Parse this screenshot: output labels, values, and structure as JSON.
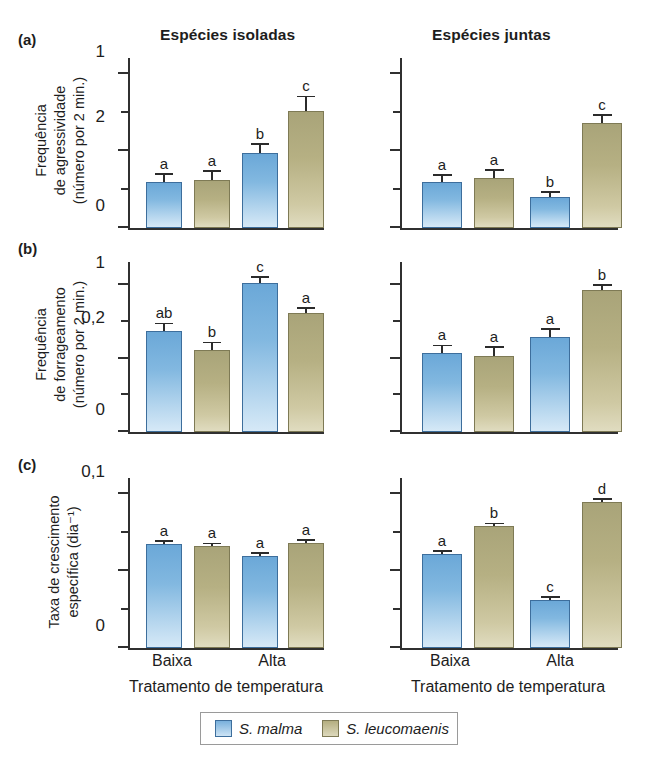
{
  "figure": {
    "column_headers": [
      "Espécies isoladas",
      "Espécies juntas"
    ],
    "xaxis_title": "Tratamento de temperatura",
    "categories": [
      "Baixa",
      "Alta"
    ],
    "legend": [
      {
        "label": "S. malma",
        "color": "#79b0dc",
        "key": "blue"
      },
      {
        "label": "S. leucomaenis",
        "color": "#b4ae80",
        "key": "olive"
      }
    ]
  },
  "panels": {
    "a": {
      "tag": "(a)",
      "ylabel_lines": [
        "Frequência",
        "de agressividade",
        "(número por 2 min.)"
      ],
      "ytick_labels": [
        "0",
        "1",
        "2"
      ]
    },
    "b": {
      "tag": "(b)",
      "ylabel_lines": [
        "Frequência",
        "de forrageamento",
        "(número por 2 min.)"
      ],
      "ytick_labels": [
        "0",
        "1",
        "2"
      ]
    },
    "c": {
      "tag": "(c)",
      "ylabel_lines": [
        "Taxa de crescimento",
        "específica (dia⁻¹)"
      ],
      "ytick_labels": [
        "0",
        "0,1",
        "0,2"
      ]
    }
  },
  "chart_data": [
    {
      "id": "a-isoladas",
      "type": "bar",
      "panel": "(a)",
      "title": "Espécies isoladas",
      "xlabel": "Tratamento de temperatura",
      "ylabel": "Frequência de agressividade (número por 2 min.)",
      "ylim": [
        0,
        2
      ],
      "yticks": [
        0,
        1,
        2
      ],
      "yminor": [
        0.5,
        1.5
      ],
      "grid": false,
      "categories": [
        "Baixa",
        "Alta"
      ],
      "series": [
        {
          "name": "S. malma",
          "values": [
            0.6,
            0.98
          ],
          "errors": [
            0.09,
            0.1
          ],
          "sig": [
            "a",
            "b"
          ]
        },
        {
          "name": "S. leucomaenis",
          "values": [
            0.63,
            1.52
          ],
          "errors": [
            0.1,
            0.18
          ],
          "sig": [
            "a",
            "c"
          ]
        }
      ]
    },
    {
      "id": "a-juntas",
      "type": "bar",
      "panel": "(a)",
      "title": "Espécies juntas",
      "xlabel": "Tratamento de temperatura",
      "ylabel": "Frequência de agressividade (número por 2 min.)",
      "ylim": [
        0,
        2
      ],
      "yticks": [
        0,
        1,
        2
      ],
      "yminor": [
        0.5,
        1.5
      ],
      "grid": false,
      "categories": [
        "Baixa",
        "Alta"
      ],
      "series": [
        {
          "name": "S. malma",
          "values": [
            0.6,
            0.4
          ],
          "errors": [
            0.08,
            0.06
          ],
          "sig": [
            "a",
            "b"
          ]
        },
        {
          "name": "S. leucomaenis",
          "values": [
            0.65,
            1.37
          ],
          "errors": [
            0.09,
            0.09
          ],
          "sig": [
            "a",
            "c"
          ]
        }
      ]
    },
    {
      "id": "b-isoladas",
      "type": "bar",
      "panel": "(b)",
      "title": "Espécies isoladas",
      "xlabel": "Tratamento de temperatura",
      "ylabel": "Frequência de forrageamento (número por 2 min.)",
      "ylim": [
        0,
        2.1
      ],
      "yticks": [
        0,
        1,
        2
      ],
      "yminor": [
        0.5,
        1.5
      ],
      "grid": false,
      "categories": [
        "Baixa",
        "Alta"
      ],
      "series": [
        {
          "name": "S. malma",
          "values": [
            1.38,
            2.03
          ],
          "errors": [
            0.09,
            0.07
          ],
          "sig": [
            "ab",
            "c"
          ]
        },
        {
          "name": "S. leucomaenis",
          "values": [
            1.12,
            1.62
          ],
          "errors": [
            0.09,
            0.06
          ],
          "sig": [
            "b",
            "a"
          ]
        }
      ]
    },
    {
      "id": "b-juntas",
      "type": "bar",
      "panel": "(b)",
      "title": "Espécies juntas",
      "xlabel": "Tratamento de temperatura",
      "ylabel": "Frequência de forrageamento (número por 2 min.)",
      "ylim": [
        0,
        2.1
      ],
      "yticks": [
        0,
        1,
        2
      ],
      "yminor": [
        0.5,
        1.5
      ],
      "grid": false,
      "categories": [
        "Baixa",
        "Alta"
      ],
      "series": [
        {
          "name": "S. malma",
          "values": [
            1.08,
            1.3
          ],
          "errors": [
            0.09,
            0.09
          ],
          "sig": [
            "a",
            "a"
          ]
        },
        {
          "name": "S. leucomaenis",
          "values": [
            1.04,
            1.93
          ],
          "errors": [
            0.11,
            0.06
          ],
          "sig": [
            "a",
            "b"
          ]
        }
      ]
    },
    {
      "id": "c-isoladas",
      "type": "bar",
      "panel": "(c)",
      "title": "Espécies isoladas",
      "xlabel": "Tratamento de temperatura",
      "ylabel": "Taxa de crescimento específica (dia⁻¹)",
      "ylim": [
        0,
        0.2
      ],
      "yticks": [
        0,
        0.1,
        0.2
      ],
      "yminor": [
        0.05,
        0.15
      ],
      "grid": false,
      "categories": [
        "Baixa",
        "Alta"
      ],
      "series": [
        {
          "name": "S. malma",
          "values": [
            0.135,
            0.12
          ],
          "errors": [
            0.002,
            0.002
          ],
          "sig": [
            "a",
            "a"
          ]
        },
        {
          "name": "S. leucomaenis",
          "values": [
            0.132,
            0.137
          ],
          "errors": [
            0.002,
            0.002
          ],
          "sig": [
            "a",
            "a"
          ]
        }
      ]
    },
    {
      "id": "c-juntas",
      "type": "bar",
      "panel": "(c)",
      "title": "Espécies juntas",
      "xlabel": "Tratamento de temperatura",
      "ylabel": "Taxa de crescimento específica (dia⁻¹)",
      "ylim": [
        0,
        0.2
      ],
      "yticks": [
        0,
        0.1,
        0.2
      ],
      "yminor": [
        0.05,
        0.15
      ],
      "grid": false,
      "categories": [
        "Baixa",
        "Alta"
      ],
      "series": [
        {
          "name": "S. malma",
          "values": [
            0.122,
            0.063
          ],
          "errors": [
            0.002,
            0.002
          ],
          "sig": [
            "a",
            "c"
          ]
        },
        {
          "name": "S. leucomaenis",
          "values": [
            0.158,
            0.19
          ],
          "errors": [
            0.002,
            0.002
          ],
          "sig": [
            "b",
            "d"
          ]
        }
      ]
    }
  ]
}
